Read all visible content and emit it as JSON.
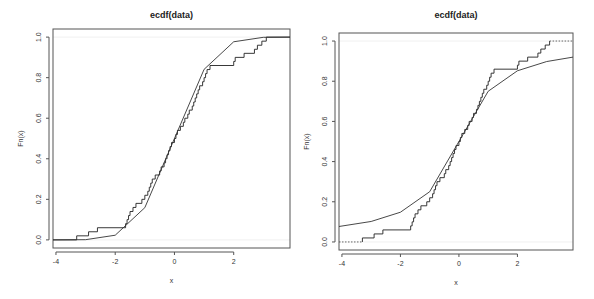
{
  "chart_data": [
    {
      "id": "left",
      "type": "line",
      "title": "ecdf(data)",
      "xlabel": "x",
      "ylabel": "Fn(x)",
      "xlim": [
        -4.1,
        3.9
      ],
      "ylim": [
        -0.04,
        1.04
      ],
      "x_ticks": [
        -4,
        -2,
        0,
        2
      ],
      "x_tick_labels": [
        "-4",
        "-2",
        "0",
        "2"
      ],
      "y_ticks": [
        0.0,
        0.2,
        0.4,
        0.6,
        0.8,
        1.0
      ],
      "y_tick_labels": [
        "0.0",
        "0.2",
        "0.4",
        "0.6",
        "0.8",
        "1.0"
      ],
      "grid": false,
      "legend": null,
      "series": [
        {
          "name": "ecdf(data)",
          "style": "step",
          "x": [
            -3.3,
            -2.9,
            -2.6,
            -1.65,
            -1.6,
            -1.5,
            -1.4,
            -1.3,
            -1.1,
            -1.0,
            -0.9,
            -0.8,
            -0.75,
            -0.65,
            -0.5,
            -0.45,
            -0.35,
            -0.3,
            -0.25,
            -0.2,
            -0.15,
            -0.1,
            0.05,
            0.1,
            0.2,
            0.3,
            0.35,
            0.5,
            0.6,
            0.7,
            0.75,
            0.85,
            0.95,
            1.05,
            1.15,
            1.2,
            1.25,
            2.0,
            2.05,
            2.35,
            2.7,
            2.95,
            3.1
          ],
          "y": [
            0.02,
            0.04,
            0.06,
            0.08,
            0.1,
            0.12,
            0.14,
            0.16,
            0.18,
            0.2,
            0.22,
            0.24,
            0.26,
            0.28,
            0.3,
            0.32,
            0.34,
            0.36,
            0.38,
            0.4,
            0.42,
            0.44,
            0.46,
            0.48,
            0.5,
            0.52,
            0.54,
            0.56,
            0.58,
            0.6,
            0.62,
            0.64,
            0.66,
            0.68,
            0.7,
            0.72,
            0.74,
            0.76,
            0.78,
            0.8,
            0.82,
            0.84,
            0.86
          ],
          "y_note": "ECDF of ~50 samples; values approximate",
          "x_start": -4.1,
          "x_end": 3.9
        },
        {
          "name": "theoretical CDF (normal)",
          "style": "line",
          "x": [
            -4.1,
            -3.0,
            -2.0,
            -1.0,
            0.0,
            1.0,
            2.0,
            3.0,
            3.9
          ],
          "y": [
            0.0,
            0.001,
            0.023,
            0.159,
            0.5,
            0.841,
            0.977,
            0.999,
            1.0
          ]
        }
      ]
    },
    {
      "id": "right",
      "type": "line",
      "title": "ecdf(data)",
      "xlabel": "x",
      "ylabel": "Fn(x)",
      "xlim": [
        -4.1,
        3.9
      ],
      "ylim": [
        -0.04,
        1.04
      ],
      "x_ticks": [
        -4,
        -2,
        0,
        2
      ],
      "x_tick_labels": [
        "-4",
        "-2",
        "0",
        "2"
      ],
      "y_ticks": [
        0.0,
        0.2,
        0.4,
        0.6,
        0.8,
        1.0
      ],
      "y_tick_labels": [
        "0.0",
        "0.2",
        "0.4",
        "0.6",
        "0.8",
        "1.0"
      ],
      "grid": false,
      "legend": null,
      "series": [
        {
          "name": "ecdf(data)",
          "style": "step",
          "x": [
            -3.3,
            -2.9,
            -2.6,
            -1.65,
            -1.6,
            -1.5,
            -1.4,
            -1.3,
            -1.1,
            -1.0,
            -0.9,
            -0.8,
            -0.75,
            -0.65,
            -0.5,
            -0.45,
            -0.35,
            -0.3,
            -0.25,
            -0.2,
            -0.15,
            -0.1,
            0.05,
            0.1,
            0.2,
            0.3,
            0.35,
            0.5,
            0.6,
            0.7,
            0.75,
            0.85,
            0.95,
            1.05,
            1.15,
            1.2,
            1.25,
            2.0,
            2.05,
            2.35,
            2.7,
            2.95,
            3.1
          ],
          "y": [
            0.02,
            0.04,
            0.06,
            0.08,
            0.1,
            0.12,
            0.14,
            0.16,
            0.18,
            0.2,
            0.22,
            0.24,
            0.26,
            0.28,
            0.3,
            0.32,
            0.34,
            0.36,
            0.38,
            0.4,
            0.42,
            0.44,
            0.46,
            0.48,
            0.5,
            0.52,
            0.54,
            0.56,
            0.58,
            0.6,
            0.62,
            0.64,
            0.66,
            0.68,
            0.7,
            0.72,
            0.74,
            0.76,
            0.78,
            0.8,
            0.82,
            0.84,
            0.86
          ],
          "y_note": "ECDF of ~50 samples; values approximate; dotted extensions at 0 and 1",
          "x_start": -4.1,
          "x_end": 3.9
        },
        {
          "name": "theoretical CDF (Cauchy)",
          "style": "line",
          "x": [
            -4.1,
            -3.0,
            -2.0,
            -1.0,
            0.0,
            1.0,
            2.0,
            3.0,
            3.9
          ],
          "y": [
            0.077,
            0.102,
            0.148,
            0.25,
            0.5,
            0.75,
            0.852,
            0.898,
            0.92
          ]
        }
      ]
    }
  ]
}
